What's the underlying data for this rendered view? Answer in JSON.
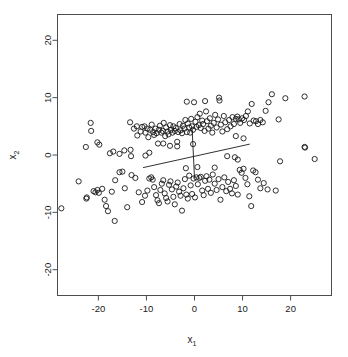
{
  "chart_data": {
    "type": "scatter",
    "title": "",
    "xlabel": "x1",
    "ylabel": "x2",
    "xlabel_base": "x",
    "xlabel_sub": "1",
    "ylabel_base": "x",
    "ylabel_sub": "2",
    "xlim": [
      -28.5,
      28.5
    ],
    "ylim": [
      -24.5,
      24.5
    ],
    "xticks": [
      -20,
      -10,
      0,
      10,
      20
    ],
    "yticks": [
      -20,
      -10,
      0,
      10,
      20
    ],
    "xtick_labels": [
      "-20",
      "-10",
      "0",
      "10",
      "20"
    ],
    "ytick_labels": [
      "-20",
      "-10",
      "0",
      "10",
      "20"
    ],
    "grid": false,
    "legend": null,
    "marker": {
      "shape": "open-circle",
      "radius": 2.6,
      "stroke": "#1a1a1a",
      "stroke_width": 0.9,
      "fill": "none"
    },
    "frame_color": "#4d4d4d",
    "annotations": [
      {
        "name": "decision-boundary",
        "type": "segment",
        "x1": -10.7,
        "y1": -2.2,
        "x2": 11.5,
        "y2": 1.9,
        "color": "#1a1a1a",
        "width": 0.9
      },
      {
        "name": "normal-vector",
        "type": "segment",
        "x1": -0.5,
        "y1": 4.6,
        "x2": 0.0,
        "y2": -4.0,
        "color": "#1a1a1a",
        "width": 0.9
      }
    ],
    "series": [
      {
        "name": "class-1",
        "points": [
          [
            -22.6,
            1.4
          ],
          [
            -21.6,
            5.6
          ],
          [
            -21.5,
            4.2
          ],
          [
            -20.2,
            2.2
          ],
          [
            -19.8,
            1.8
          ],
          [
            -17.6,
            0.3
          ],
          [
            -16.9,
            0.6
          ],
          [
            -15.6,
            0.2
          ],
          [
            -13.4,
            5.7
          ],
          [
            -12.6,
            4.6
          ],
          [
            -12.0,
            5.0
          ],
          [
            -11.9,
            3.4
          ],
          [
            -11.2,
            4.1
          ],
          [
            -10.9,
            4.9
          ],
          [
            -10.4,
            5.0
          ],
          [
            -10.2,
            3.9
          ],
          [
            -9.8,
            4.6
          ],
          [
            -9.6,
            3.1
          ],
          [
            -9.2,
            4.4
          ],
          [
            -8.9,
            5.3
          ],
          [
            -8.6,
            4.0
          ],
          [
            -8.4,
            3.5
          ],
          [
            -8.1,
            4.6
          ],
          [
            -7.9,
            3.8
          ],
          [
            -7.6,
            2.0
          ],
          [
            -7.4,
            4.4
          ],
          [
            -7.2,
            5.1
          ],
          [
            -6.9,
            3.9
          ],
          [
            -6.6,
            4.2
          ],
          [
            -6.4,
            5.6
          ],
          [
            -6.1,
            3.3
          ],
          [
            -5.9,
            4.8
          ],
          [
            -5.6,
            4.1
          ],
          [
            -5.4,
            3.6
          ],
          [
            -5.1,
            5.2
          ],
          [
            -4.9,
            4.4
          ],
          [
            -4.6,
            3.9
          ],
          [
            -4.4,
            5.0
          ],
          [
            -4.1,
            4.2
          ],
          [
            -3.9,
            4.7
          ],
          [
            -3.6,
            2.3
          ],
          [
            -3.4,
            4.0
          ],
          [
            -3.1,
            5.4
          ],
          [
            -2.9,
            4.3
          ],
          [
            -2.6,
            3.8
          ],
          [
            -2.4,
            5.1
          ],
          [
            -2.1,
            4.6
          ],
          [
            -1.9,
            6.1
          ],
          [
            -1.6,
            4.0
          ],
          [
            -1.4,
            5.5
          ],
          [
            -1.1,
            4.8
          ],
          [
            -0.9,
            3.9
          ],
          [
            -0.7,
            6.3
          ],
          [
            -0.5,
            5.0
          ],
          [
            -0.3,
            4.4
          ],
          [
            -0.1,
            9.2
          ],
          [
            0.2,
            5.8
          ],
          [
            0.4,
            4.9
          ],
          [
            0.6,
            6.6
          ],
          [
            0.9,
            5.2
          ],
          [
            1.1,
            7.2
          ],
          [
            1.3,
            4.7
          ],
          [
            1.6,
            6.0
          ],
          [
            1.8,
            5.4
          ],
          [
            2.1,
            4.2
          ],
          [
            2.4,
            7.6
          ],
          [
            2.6,
            5.9
          ],
          [
            2.9,
            4.6
          ],
          [
            3.2,
            6.4
          ],
          [
            3.4,
            5.1
          ],
          [
            3.7,
            3.9
          ],
          [
            4.0,
            5.6
          ],
          [
            4.3,
            7.0
          ],
          [
            4.6,
            4.8
          ],
          [
            4.9,
            6.2
          ],
          [
            5.2,
            9.5
          ],
          [
            5.5,
            5.3
          ],
          [
            5.8,
            4.1
          ],
          [
            6.1,
            6.8
          ],
          [
            6.4,
            5.7
          ],
          [
            6.8,
            4.5
          ],
          [
            7.2,
            6.1
          ],
          [
            7.5,
            5.0
          ],
          [
            7.9,
            6.6
          ],
          [
            8.2,
            5.4
          ],
          [
            8.6,
            6.3
          ],
          [
            8.9,
            6.7
          ],
          [
            9.2,
            6.2
          ],
          [
            9.5,
            5.6
          ],
          [
            9.9,
            6.4
          ],
          [
            10.3,
            6.1
          ],
          [
            10.7,
            6.8
          ],
          [
            11.1,
            7.6
          ],
          [
            11.5,
            5.5
          ],
          [
            11.9,
            8.9
          ],
          [
            12.3,
            6.0
          ],
          [
            12.8,
            5.9
          ],
          [
            13.2,
            5.4
          ],
          [
            13.7,
            6.1
          ],
          [
            14.2,
            5.7
          ],
          [
            14.8,
            7.7
          ],
          [
            15.4,
            9.2
          ],
          [
            16.1,
            10.6
          ],
          [
            17.5,
            6.2
          ],
          [
            18.9,
            9.9
          ],
          [
            22.9,
            10.2
          ],
          [
            -1.6,
            9.3
          ],
          [
            2.2,
            9.4
          ],
          [
            5.1,
            10.0
          ],
          [
            -3.6,
            1.5
          ],
          [
            -5.1,
            1.6
          ],
          [
            -6.5,
            2.0
          ],
          [
            -0.3,
            1.9
          ],
          [
            8.6,
            3.3
          ],
          [
            10.2,
            2.9
          ],
          [
            -13.3,
            0.9
          ],
          [
            -14.6,
            0.8
          ],
          [
            -9.4,
            0.4
          ]
        ]
      },
      {
        "name": "class-2",
        "points": [
          [
            -27.7,
            -9.3
          ],
          [
            -24.1,
            -4.6
          ],
          [
            -22.5,
            -7.6
          ],
          [
            -22.4,
            -7.4
          ],
          [
            -21.0,
            -6.3
          ],
          [
            -20.6,
            -6.5
          ],
          [
            -20.2,
            -6.1
          ],
          [
            -19.9,
            -6.6
          ],
          [
            -19.2,
            -5.9
          ],
          [
            -18.7,
            -7.8
          ],
          [
            -18.4,
            -8.9
          ],
          [
            -18.0,
            -9.8
          ],
          [
            -17.2,
            -6.4
          ],
          [
            -16.6,
            -11.5
          ],
          [
            -15.6,
            -3.0
          ],
          [
            -15.0,
            -2.9
          ],
          [
            -14.5,
            -5.8
          ],
          [
            -14.0,
            -9.1
          ],
          [
            -13.1,
            -3.5
          ],
          [
            -12.3,
            -4.0
          ],
          [
            -11.6,
            -6.5
          ],
          [
            -10.9,
            -8.2
          ],
          [
            -10.3,
            -7.1
          ],
          [
            -9.8,
            -6.2
          ],
          [
            -9.4,
            -4.1
          ],
          [
            -9.0,
            -3.9
          ],
          [
            -8.7,
            -4.3
          ],
          [
            -8.4,
            -5.6
          ],
          [
            -8.0,
            -7.0
          ],
          [
            -7.7,
            -7.9
          ],
          [
            -7.4,
            -8.4
          ],
          [
            -7.1,
            -6.1
          ],
          [
            -6.8,
            -5.0
          ],
          [
            -6.5,
            -4.4
          ],
          [
            -6.2,
            -6.7
          ],
          [
            -5.9,
            -7.5
          ],
          [
            -5.6,
            -8.1
          ],
          [
            -5.3,
            -5.2
          ],
          [
            -5.0,
            -4.6
          ],
          [
            -4.7,
            -6.0
          ],
          [
            -4.4,
            -7.3
          ],
          [
            -4.1,
            -8.6
          ],
          [
            -3.8,
            -5.5
          ],
          [
            -3.5,
            -4.8
          ],
          [
            -3.2,
            -6.4
          ],
          [
            -2.9,
            -7.1
          ],
          [
            -2.6,
            -9.7
          ],
          [
            -2.3,
            -5.8
          ],
          [
            -2.0,
            -4.2
          ],
          [
            -1.7,
            -6.9
          ],
          [
            -1.4,
            -7.6
          ],
          [
            -1.1,
            -3.6
          ],
          [
            -0.8,
            -5.3
          ],
          [
            -0.5,
            -6.8
          ],
          [
            -0.2,
            -4.1
          ],
          [
            0.1,
            -7.4
          ],
          [
            0.4,
            -3.9
          ],
          [
            0.7,
            -5.1
          ],
          [
            1.0,
            -4.0
          ],
          [
            1.3,
            -3.8
          ],
          [
            1.6,
            -6.2
          ],
          [
            1.9,
            -7.0
          ],
          [
            2.2,
            -4.5
          ],
          [
            2.5,
            -3.7
          ],
          [
            2.8,
            -5.9
          ],
          [
            3.1,
            -4.3
          ],
          [
            3.4,
            -6.6
          ],
          [
            3.8,
            -3.4
          ],
          [
            4.2,
            -5.0
          ],
          [
            4.6,
            -6.1
          ],
          [
            5.0,
            -4.2
          ],
          [
            5.4,
            -7.8
          ],
          [
            5.8,
            -5.6
          ],
          [
            6.2,
            -3.9
          ],
          [
            6.6,
            -6.3
          ],
          [
            7.0,
            -4.7
          ],
          [
            7.4,
            -5.9
          ],
          [
            7.8,
            -6.7
          ],
          [
            8.2,
            -4.4
          ],
          [
            8.6,
            -5.4
          ],
          [
            9.0,
            -6.9
          ],
          [
            9.4,
            -2.6
          ],
          [
            9.8,
            -3.1
          ],
          [
            10.2,
            -2.4
          ],
          [
            10.6,
            -4.0
          ],
          [
            11.0,
            -5.1
          ],
          [
            11.4,
            -7.2
          ],
          [
            11.8,
            -8.9
          ],
          [
            12.2,
            -2.7
          ],
          [
            12.7,
            -3.0
          ],
          [
            13.2,
            -4.3
          ],
          [
            13.7,
            -5.8
          ],
          [
            14.4,
            -4.9
          ],
          [
            15.2,
            -6.0
          ],
          [
            16.9,
            -6.2
          ],
          [
            17.8,
            -1.1
          ],
          [
            22.9,
            1.4
          ],
          [
            23.0,
            1.3
          ],
          [
            25.0,
            -0.7
          ],
          [
            -13.2,
            -0.2
          ],
          [
            -10.2,
            -0.1
          ],
          [
            6.8,
            -0.2
          ],
          [
            8.4,
            -0.4
          ],
          [
            9.0,
            -0.8
          ],
          [
            -1.8,
            -2.3
          ],
          [
            0.6,
            -2.1
          ],
          [
            4.2,
            -2.2
          ],
          [
            -16.5,
            -4.4
          ]
        ]
      }
    ]
  },
  "axes": {
    "x_axis_name": "x-axis",
    "y_axis_name": "y-axis"
  }
}
